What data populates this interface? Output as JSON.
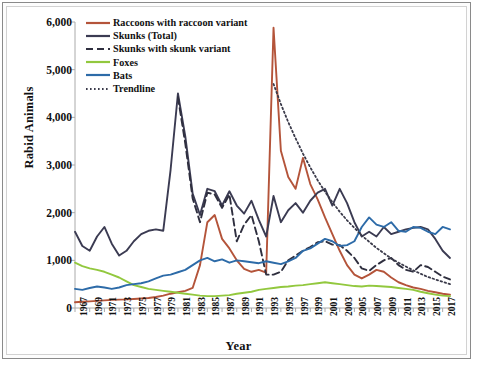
{
  "chart_data": {
    "type": "line",
    "title": "",
    "xlabel": "Year",
    "ylabel": "Rabid Animals",
    "xlim": [
      1967,
      2018
    ],
    "ylim": [
      0,
      6000
    ],
    "grid": false,
    "legend_position": "top-left",
    "ytick_labels": [
      "0",
      "1,000",
      "2,000",
      "3,000",
      "4,000",
      "5,000",
      "6,000"
    ],
    "ytick_values": [
      0,
      1000,
      2000,
      3000,
      4000,
      5000,
      6000
    ],
    "xtick_labels": [
      "1967",
      "1969",
      "1971",
      "1973",
      "1975",
      "1977",
      "1979",
      "1981",
      "1983",
      "1985",
      "1987",
      "1989",
      "1991",
      "1993",
      "1995",
      "1997",
      "1999",
      "2001",
      "2003",
      "2005",
      "2007",
      "2009",
      "2011",
      "2013",
      "2015",
      "2017"
    ],
    "x": [
      1967,
      1968,
      1969,
      1970,
      1971,
      1972,
      1973,
      1974,
      1975,
      1976,
      1977,
      1978,
      1979,
      1980,
      1981,
      1982,
      1983,
      1984,
      1985,
      1986,
      1987,
      1988,
      1989,
      1990,
      1991,
      1992,
      1993,
      1994,
      1995,
      1996,
      1997,
      1998,
      1999,
      2000,
      2001,
      2002,
      2003,
      2004,
      2005,
      2006,
      2007,
      2008,
      2009,
      2010,
      2011,
      2012,
      2013,
      2014,
      2015,
      2016,
      2017,
      2018
    ],
    "series": [
      {
        "name": "Raccoons with raccoon variant",
        "color": "#b4543a",
        "style": "solid",
        "width": 1.9,
        "values": [
          120,
          130,
          140,
          150,
          160,
          170,
          175,
          180,
          190,
          200,
          210,
          230,
          260,
          300,
          330,
          360,
          420,
          900,
          1800,
          1950,
          1450,
          1250,
          1000,
          820,
          760,
          800,
          740,
          5880,
          3300,
          2750,
          2500,
          3150,
          2600,
          2280,
          1900,
          1550,
          1200,
          900,
          700,
          620,
          700,
          800,
          760,
          640,
          540,
          480,
          430,
          400,
          360,
          330,
          300,
          280
        ]
      },
      {
        "name": "Skunks (Total)",
        "color": "#3b3b52",
        "style": "solid",
        "width": 1.9,
        "values": [
          1600,
          1300,
          1200,
          1500,
          1700,
          1350,
          1100,
          1200,
          1400,
          1550,
          1620,
          1650,
          1620,
          2900,
          4500,
          3600,
          2400,
          1950,
          2500,
          2450,
          2150,
          2450,
          2150,
          1980,
          2250,
          1850,
          1500,
          2350,
          1800,
          2050,
          2200,
          2000,
          2250,
          2420,
          2500,
          2150,
          2500,
          2200,
          1800,
          1500,
          1600,
          1500,
          1700,
          1550,
          1600,
          1650,
          1680,
          1700,
          1650,
          1450,
          1200,
          1050
        ]
      },
      {
        "name": "Skunks with skunk variant",
        "color": "#2f2f3f",
        "style": "dashed",
        "width": 1.9,
        "start_year": 1981,
        "values": [
          null,
          null,
          null,
          null,
          null,
          null,
          null,
          null,
          null,
          null,
          null,
          null,
          null,
          null,
          4420,
          3450,
          2300,
          1800,
          2420,
          2380,
          2100,
          2380,
          1400,
          1750,
          1950,
          1400,
          700,
          700,
          760,
          1000,
          1100,
          1200,
          1280,
          1380,
          1400,
          1330,
          1320,
          1200,
          1050,
          830,
          780,
          900,
          1000,
          1050,
          900,
          800,
          760,
          900,
          860,
          760,
          660,
          600
        ]
      },
      {
        "name": "Foxes",
        "color": "#92c83e",
        "style": "solid",
        "width": 1.9,
        "values": [
          950,
          880,
          830,
          800,
          760,
          700,
          640,
          560,
          480,
          440,
          400,
          380,
          360,
          340,
          320,
          300,
          280,
          260,
          250,
          250,
          260,
          270,
          300,
          320,
          340,
          380,
          400,
          420,
          440,
          450,
          470,
          480,
          500,
          520,
          540,
          520,
          500,
          480,
          460,
          450,
          470,
          460,
          450,
          440,
          420,
          400,
          380,
          340,
          310,
          280,
          260,
          250
        ]
      },
      {
        "name": "Bats",
        "color": "#2d6ba8",
        "style": "solid",
        "width": 1.9,
        "values": [
          400,
          380,
          420,
          450,
          430,
          400,
          430,
          480,
          500,
          520,
          560,
          620,
          680,
          700,
          750,
          800,
          900,
          1000,
          1050,
          980,
          1020,
          950,
          1000,
          980,
          960,
          940,
          980,
          950,
          920,
          980,
          1050,
          1200,
          1250,
          1350,
          1450,
          1400,
          1300,
          1320,
          1400,
          1700,
          1900,
          1750,
          1700,
          1800,
          1620,
          1600,
          1700,
          1680,
          1600,
          1550,
          1700,
          1650
        ]
      },
      {
        "name": "Trendline",
        "color": "#3a3a4a",
        "style": "dotted",
        "width": 1.8,
        "start_year": 1994,
        "values": [
          null,
          null,
          null,
          null,
          null,
          null,
          null,
          null,
          null,
          null,
          null,
          null,
          null,
          null,
          null,
          null,
          null,
          null,
          null,
          null,
          null,
          null,
          null,
          null,
          null,
          null,
          null,
          4700,
          4280,
          3900,
          3560,
          3240,
          2950,
          2680,
          2440,
          2220,
          2020,
          1840,
          1680,
          1520,
          1390,
          1260,
          1150,
          1040,
          950,
          870,
          790,
          720,
          650,
          600,
          550,
          500
        ]
      }
    ]
  }
}
